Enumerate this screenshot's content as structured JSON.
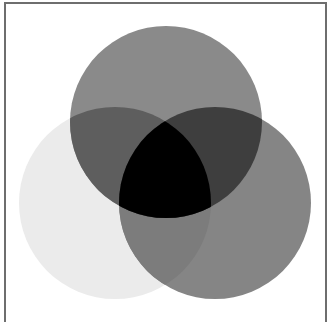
{
  "diagram": {
    "type": "venn",
    "set_count": 3,
    "sets": [
      {
        "id": "top",
        "cx": 166,
        "cy": 122,
        "r": 96,
        "fill": "#8a8a8a"
      },
      {
        "id": "left",
        "cx": 115,
        "cy": 203,
        "r": 96,
        "fill": "#ebebeb"
      },
      {
        "id": "right",
        "cx": 215,
        "cy": 203,
        "r": 96,
        "fill": "#858585"
      }
    ],
    "regions": {
      "top_only": "#8a8a8a",
      "left_only": "#ebebeb",
      "right_only": "#858585",
      "top_left": "#5e5e5e",
      "top_right": "#3e3e3e",
      "left_right": "#7c7c7c",
      "all_three": "#000000"
    },
    "frame_color": "#6e6e6e",
    "background": "#ffffff"
  }
}
